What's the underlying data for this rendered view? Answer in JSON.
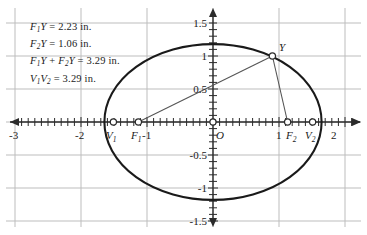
{
  "figure": {
    "type": "ellipse-focus-diagram",
    "background": "#ffffff",
    "grid_color": "#b9b9b9",
    "axis_color": "#333333",
    "curve_color": "#1a1a1a",
    "segment_color": "#4a4a4a"
  },
  "annotations": {
    "line1": "F₁Y = 2.23 in.",
    "line2": "F₂Y = 1.06 in.",
    "line3": "F₁Y + F₂Y = 3.29 in.",
    "line4": "V₁V₂ = 3.29 in.",
    "values": {
      "f1y": 2.23,
      "f2y": 1.06,
      "sum_f1y_f2y": 3.29,
      "v1v2": 3.29,
      "units": "in."
    }
  },
  "axes": {
    "x_label_ticks": [
      "-3",
      "-2",
      "-1",
      "1",
      "2"
    ],
    "y_label_ticks": [
      "1.5",
      "1",
      "0.5",
      "-0.5",
      "-1",
      "-1.5"
    ],
    "origin_label": "O",
    "x_range": [
      -3.1,
      2.15
    ],
    "y_range": [
      -1.62,
      1.62
    ],
    "x_gridlines": [
      -3,
      -2,
      -1,
      0,
      1,
      2
    ],
    "y_gridlines": [
      -1.5,
      -1,
      -0.5,
      0,
      0.5,
      1,
      1.5
    ],
    "minor_tick_step": 0.1,
    "grid": true
  },
  "points": {
    "V1": {
      "label": "V₁",
      "x": -1.645,
      "y": 0
    },
    "F1": {
      "label": "F₁",
      "x": -1.13,
      "y": 0
    },
    "O": {
      "label": "O",
      "x": 0,
      "y": 0
    },
    "F2": {
      "label": "F₂",
      "x": 1.13,
      "y": 0
    },
    "V2": {
      "label": "V₂",
      "x": 1.645,
      "y": 0
    },
    "Y": {
      "label": "Y",
      "x": 0.9,
      "y": 1.0
    }
  },
  "ellipse": {
    "center": [
      0,
      0
    ],
    "semi_major_a": 1.645,
    "semi_minor_b": 1.18,
    "focal_c": 1.13
  },
  "segments": [
    {
      "name": "F1-to-Y",
      "from": "F1",
      "to": "Y"
    },
    {
      "name": "F2-to-Y",
      "from": "F2",
      "to": "Y"
    }
  ]
}
